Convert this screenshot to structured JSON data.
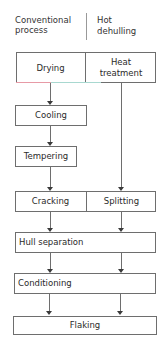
{
  "header": {
    "left_line1": "Conventional",
    "left_line2": "process",
    "right_line1": "Hot",
    "right_line2": "dehulling"
  },
  "steps": {
    "drying": "Drying",
    "heat_treatment_line1": "Heat",
    "heat_treatment_line2": "treatment",
    "cooling": "Cooling",
    "tempering": "Tempering",
    "cracking": "Cracking",
    "splitting": "Splitting",
    "hull_separation": "Hull separation",
    "conditioning": "Conditioning",
    "flaking": "Flaking"
  },
  "colors": {
    "line": "#6e6e6e",
    "arrow": "#3a3a3a",
    "text": "#2a2a2a"
  }
}
